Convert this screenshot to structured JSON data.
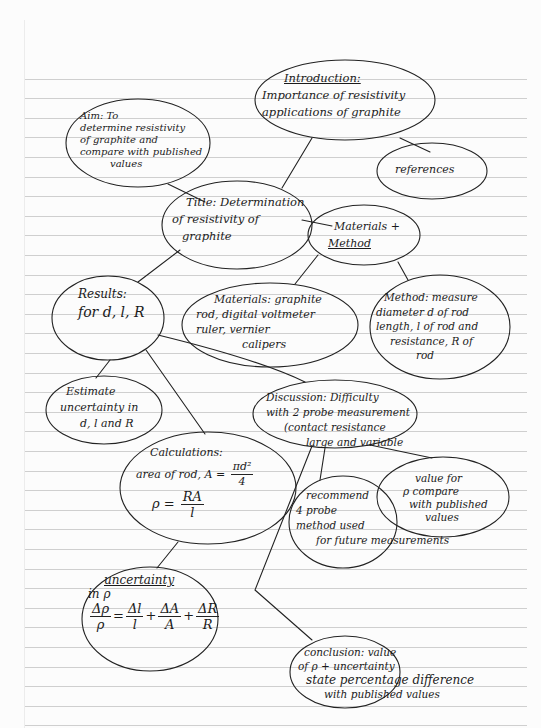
{
  "document": {
    "type": "hand-drawn mind map on ruled notebook paper",
    "ink_color": "#1b1b1b",
    "paper_color": "#fcfcfc",
    "rule_color": "#cfcfcf"
  },
  "nodes": {
    "title": {
      "heading": "Title:",
      "lines": [
        "Title: Determination",
        "of resistivity of",
        "graphite"
      ]
    },
    "aim": {
      "heading": "Aim",
      "lines": [
        "Aim: To",
        "determine resistivity",
        "of graphite and",
        "compare with published",
        "values"
      ]
    },
    "introduction": {
      "heading": "Introduction:",
      "lines": [
        "Introduction:",
        "Importance of resistivity",
        "applications of graphite"
      ]
    },
    "references": {
      "lines": [
        "references"
      ]
    },
    "materials_method": {
      "lines": [
        "Materials +",
        "Method"
      ]
    },
    "materials": {
      "lines": [
        "Materials: graphite",
        "rod, digital voltmeter",
        "ruler, vernier",
        "calipers"
      ]
    },
    "method": {
      "lines": [
        "Method: measure",
        "diameter d of rod",
        "length, l of rod and",
        "resistance, R of",
        "rod"
      ]
    },
    "results": {
      "lines": [
        "Results:",
        "for d, l, R"
      ]
    },
    "estimate_uncertainty": {
      "lines": [
        "Estimate",
        "uncertainty in",
        "d, l and R"
      ]
    },
    "calculations": {
      "title": "Calculations:",
      "area_label": "area of rod, A =",
      "area_num": "πd²",
      "area_den": "4",
      "rho_label": "ρ =",
      "rho_num": "RA",
      "rho_den": "l"
    },
    "uncertainty": {
      "title": "uncertainty",
      "sub": "in ρ",
      "lhs_num": "Δρ",
      "lhs_den": "ρ",
      "t1_num": "Δl",
      "t1_den": "l",
      "t2_num": "ΔA",
      "t2_den": "A",
      "t3_num": "ΔR",
      "t3_den": "R",
      "eq": "=",
      "plus": "+"
    },
    "discussion": {
      "lines": [
        "Discussion: Difficulty",
        "with 2 probe measurement",
        "(contact resistance",
        "large and variable"
      ]
    },
    "recommend": {
      "lines": [
        "recommend",
        "4 probe",
        "method used",
        "for future measurements"
      ]
    },
    "value_compare": {
      "lines": [
        "value for",
        "ρ compare",
        "with published",
        "values"
      ]
    },
    "conclusion": {
      "lines": [
        "conclusion: value",
        "of ρ + uncertainty",
        "state percentage difference",
        "with published values"
      ]
    }
  }
}
